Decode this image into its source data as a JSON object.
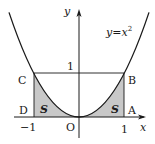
{
  "figure": {
    "type": "function-graph-diagram",
    "curve_label": "y=x²",
    "curve_label_parts": {
      "y": "y",
      "eq": "=",
      "x": "x",
      "exp": "2"
    },
    "axes": {
      "x_label": "x",
      "y_label": "y",
      "origin_label": "O"
    },
    "ticks": {
      "x_neg": "−1",
      "x_pos": "1",
      "y_pos": "1"
    },
    "points": {
      "A": "A",
      "B": "B",
      "C": "C",
      "D": "D"
    },
    "shaded_regions": [
      {
        "label": "S",
        "side": "left"
      },
      {
        "label": "S",
        "side": "right"
      }
    ],
    "colors": {
      "line": "#1a1a1a",
      "shade": "#c8c8c8",
      "background": "#ffffff"
    }
  }
}
